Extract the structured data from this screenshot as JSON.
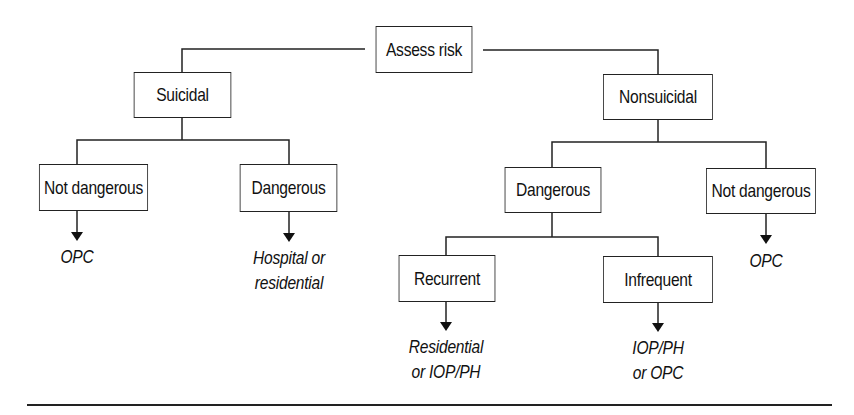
{
  "diagram": {
    "type": "decision-tree",
    "root": {
      "label": "Assess risk",
      "children": [
        {
          "label": "Suicidal",
          "children": [
            {
              "label": "Not dangerous",
              "outcome": [
                "OPC"
              ]
            },
            {
              "label": "Dangerous",
              "outcome": [
                "Hospital or",
                "residential"
              ]
            }
          ]
        },
        {
          "label": "Nonsuicidal",
          "children": [
            {
              "label": "Dangerous",
              "children": [
                {
                  "label": "Recurrent",
                  "outcome": [
                    "Residential",
                    "or IOP/PH"
                  ]
                },
                {
                  "label": "Infrequent",
                  "outcome": [
                    "IOP/PH",
                    "or OPC"
                  ]
                }
              ]
            },
            {
              "label": "Not dangerous",
              "outcome": [
                "OPC"
              ]
            }
          ]
        }
      ]
    }
  },
  "nodes": {
    "assess_risk": "Assess risk",
    "suicidal": "Suicidal",
    "nonsuicidal": "Nonsuicidal",
    "suicidal_not_dangerous": "Not dangerous",
    "suicidal_dangerous": "Dangerous",
    "nonsuicidal_dangerous": "Dangerous",
    "nonsuicidal_not_dangerous": "Not dangerous",
    "recurrent": "Recurrent",
    "infrequent": "Infrequent"
  },
  "outcomes": {
    "suicidal_not_dangerous": [
      "OPC"
    ],
    "suicidal_dangerous": [
      "Hospital or",
      "residential"
    ],
    "nonsuicidal_not_dangerous": [
      "OPC"
    ],
    "recurrent": [
      "Residential",
      "or IOP/PH"
    ],
    "infrequent": [
      "IOP/PH",
      "or OPC"
    ]
  },
  "colors": {
    "line": "#222222",
    "background": "#ffffff",
    "text": "#111111"
  }
}
